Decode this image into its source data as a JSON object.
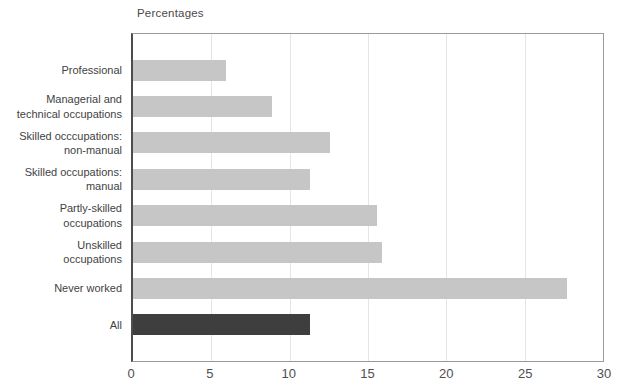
{
  "colors": {
    "bar": "#c5c6c5",
    "highlight_bar": "#3e3e3e",
    "grid": "#e4e6e4",
    "frame": "#9a9a9a",
    "axis": "#4d4d4d",
    "category_text": "#3f3f3f",
    "tick_text": "#4f4f4f"
  },
  "chart_data": {
    "type": "bar",
    "orientation": "horizontal",
    "title": "Percentages",
    "categories": [
      "Professional",
      "Managerial and\ntechnical occupations",
      "Skilled occcupations:\nnon-manual",
      "Skilled occupations:\nmanual",
      "Partly-skilled\noccupations",
      "Unskilled\noccupations",
      "Never worked",
      "All"
    ],
    "values": [
      5.9,
      8.8,
      12.5,
      11.2,
      15.5,
      15.8,
      27.5,
      11.2
    ],
    "highlight_index": 7,
    "highlight_category": "All",
    "xlabel": "Percentages",
    "ylabel": "",
    "xlim": [
      0,
      30
    ],
    "xticks": [
      0,
      5,
      10,
      15,
      20,
      25,
      30
    ],
    "grid": "vertical",
    "legend": "none"
  }
}
